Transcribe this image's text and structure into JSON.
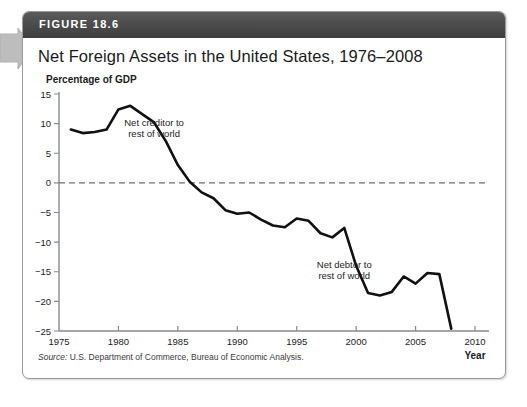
{
  "figure": {
    "header_label": "FIGURE 18.6",
    "title": "Net Foreign Assets in the United States, 1976–2008",
    "unit_label": "Percentage of GDP",
    "source_prefix": "Source:",
    "source_text": " U.S. Department of Commerce, Bureau of Economic Analysis.",
    "colors": {
      "header_bar": "#4a4a4a",
      "card_border": "#9a9a9a",
      "line": "#111111",
      "axis": "#8a8a8a",
      "zero_line": "#6f6f6f",
      "arrow_marker": "#b8b8b8"
    }
  },
  "annotations": {
    "creditor_line1": "Net creditor to",
    "creditor_line2": "rest of world",
    "debtor_line1": "Net debtor to",
    "debtor_line2": "rest of world"
  },
  "chart_data": {
    "type": "line",
    "title": "Net Foreign Assets in the United States, 1976–2008",
    "xlabel": "Year",
    "ylabel": "Percentage of GDP",
    "xlim": [
      1975,
      2010
    ],
    "ylim": [
      -25,
      15
    ],
    "xticks": [
      1975,
      1980,
      1985,
      1990,
      1995,
      2000,
      2005,
      2010
    ],
    "xtick_labels": [
      "1975",
      "1980",
      "1985",
      "1990",
      "1995",
      "2000",
      "2005",
      "2010"
    ],
    "yticks": [
      -25,
      -20,
      -15,
      -10,
      -5,
      0,
      5,
      10,
      15
    ],
    "ytick_labels": [
      "−25",
      "−20",
      "−15",
      "−10",
      "−5",
      "0",
      "5",
      "10",
      "15"
    ],
    "grid": false,
    "zero_reference_line": 0,
    "legend": null,
    "x": [
      1976,
      1977,
      1978,
      1979,
      1980,
      1981,
      1982,
      1983,
      1984,
      1985,
      1986,
      1987,
      1988,
      1989,
      1990,
      1991,
      1992,
      1993,
      1994,
      1995,
      1996,
      1997,
      1998,
      1999,
      2000,
      2001,
      2002,
      2003,
      2004,
      2005,
      2006,
      2007,
      2008
    ],
    "values": [
      9.0,
      8.4,
      8.6,
      9.0,
      12.4,
      13.0,
      11.6,
      10.2,
      7.0,
      3.0,
      0.2,
      -1.6,
      -2.6,
      -4.6,
      -5.2,
      -5.0,
      -6.2,
      -7.2,
      -7.5,
      -6.0,
      -6.4,
      -8.5,
      -9.2,
      -7.6,
      -14.0,
      -18.6,
      -19.0,
      -18.4,
      -15.8,
      -17.0,
      -15.2,
      -15.4,
      -24.6
    ],
    "annotations": [
      {
        "text": "Net creditor to rest of world",
        "x": 1983,
        "y": 9
      },
      {
        "text": "Net debtor to rest of world",
        "x": 1999,
        "y": -15
      }
    ]
  }
}
